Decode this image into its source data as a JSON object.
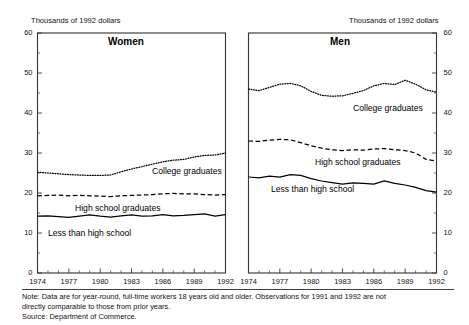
{
  "figure": {
    "units_label_left": "Thousands of 1992 dollars",
    "units_label_right": "Thousands of 1992 dollars",
    "note_line_1": "Note: Data are for year-round, full-time workers 18 years old and older.  Observations for 1991 and 1992 are not",
    "note_line_2": "directly comparable to those from prior years.",
    "note_line_3": "Source: Department of Commerce."
  },
  "chart_data": {
    "type": "line",
    "subtitle": "Thousands of 1992 dollars",
    "xlabel": "",
    "ylabel": "Thousands of 1992 dollars",
    "xlim": [
      1974,
      1992
    ],
    "ylim": [
      0,
      60
    ],
    "ytick_major": [
      0,
      10,
      20,
      30,
      40,
      50,
      60
    ],
    "ytick_minor": [
      5,
      15,
      25,
      35,
      45,
      55
    ],
    "xticks": [
      1974,
      1977,
      1980,
      1983,
      1986,
      1989,
      1992
    ],
    "xtick_minor": [
      1975,
      1976,
      1978,
      1979,
      1981,
      1982,
      1984,
      1985,
      1987,
      1988,
      1990,
      1991
    ],
    "x": [
      1974,
      1975,
      1976,
      1977,
      1978,
      1979,
      1980,
      1981,
      1982,
      1983,
      1984,
      1985,
      1986,
      1987,
      1988,
      1989,
      1990,
      1991,
      1992
    ],
    "grid": false,
    "legend_position": "inline-labels",
    "panels": [
      {
        "name": "women",
        "title": "Women",
        "axis_side": "left",
        "series": [
          {
            "name": "College graduates",
            "style": "dotted",
            "label": "College graduates",
            "values": [
              25.2,
              25.0,
              24.8,
              24.6,
              24.5,
              24.4,
              24.4,
              24.5,
              25.3,
              26.0,
              26.6,
              27.2,
              27.8,
              28.2,
              28.4,
              29.0,
              29.4,
              29.5,
              30.0
            ]
          },
          {
            "name": "High school graduates",
            "style": "dashed",
            "label": "High school graduates",
            "values": [
              19.3,
              19.4,
              19.5,
              19.3,
              19.4,
              19.3,
              19.2,
              19.1,
              19.3,
              19.4,
              19.5,
              19.6,
              19.8,
              19.9,
              19.8,
              19.8,
              19.6,
              19.5,
              19.6
            ]
          },
          {
            "name": "Less than high school",
            "style": "solid",
            "label": "Less than high school",
            "values": [
              14.2,
              14.3,
              14.1,
              13.9,
              14.2,
              14.5,
              14.2,
              14.0,
              14.3,
              14.5,
              14.2,
              14.3,
              14.6,
              14.3,
              14.4,
              14.6,
              14.8,
              14.2,
              14.6
            ]
          }
        ]
      },
      {
        "name": "men",
        "title": "Men",
        "axis_side": "right",
        "series": [
          {
            "name": "College graduates",
            "style": "dotted",
            "label": "College graduates",
            "values": [
              46.0,
              45.6,
              46.4,
              47.2,
              47.4,
              46.8,
              45.4,
              44.4,
              44.2,
              44.3,
              44.9,
              45.6,
              46.8,
              47.4,
              47.1,
              48.2,
              47.2,
              45.8,
              45.2
            ]
          },
          {
            "name": "High school graduates",
            "style": "dashed",
            "label": "High school graduates",
            "values": [
              33.0,
              32.9,
              33.2,
              33.4,
              33.3,
              32.6,
              31.8,
              31.2,
              30.8,
              30.6,
              30.8,
              30.7,
              31.0,
              31.1,
              30.8,
              30.6,
              30.0,
              28.4,
              28.0
            ]
          },
          {
            "name": "Less than high school",
            "style": "solid",
            "label": "Less than high school",
            "values": [
              24.0,
              23.8,
              24.2,
              24.0,
              24.6,
              24.4,
              23.6,
              23.0,
              22.6,
              22.2,
              22.5,
              22.4,
              22.2,
              23.0,
              22.4,
              22.0,
              21.4,
              20.6,
              20.2
            ]
          }
        ]
      }
    ]
  },
  "axis_labels": {
    "y_major": [
      "0",
      "10",
      "20",
      "30",
      "40",
      "50",
      "60"
    ],
    "x": [
      "1974",
      "1977",
      "1980",
      "1983",
      "1986",
      "1989",
      "1992"
    ]
  },
  "series_labels": {
    "women_college": "College graduates",
    "women_highschool": "High school graduates",
    "women_lessthan": "Less than high school",
    "men_college": "College graduates",
    "men_highschool": "High school graduates",
    "men_lessthan": "Less than high school"
  }
}
